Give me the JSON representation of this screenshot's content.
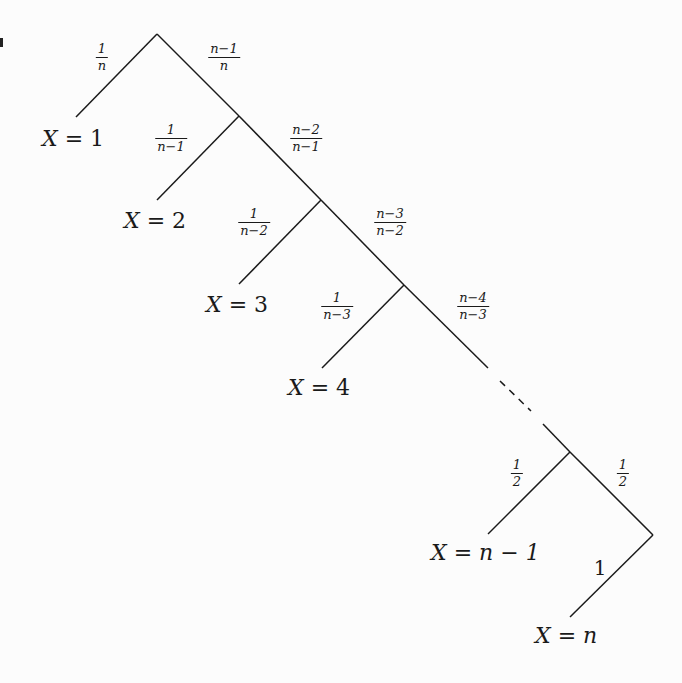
{
  "diagram": {
    "type": "probability-tree",
    "stroke_color": "#1a1a1a",
    "background": "#fcfcfc",
    "nodes": [
      {
        "id": "root",
        "x": 157,
        "y": 34
      },
      {
        "id": "n2",
        "x": 239,
        "y": 116
      },
      {
        "id": "n3",
        "x": 321,
        "y": 200
      },
      {
        "id": "n4",
        "x": 404,
        "y": 285
      },
      {
        "id": "nm1",
        "x": 570,
        "y": 452
      },
      {
        "id": "turn",
        "x": 653,
        "y": 535
      }
    ],
    "edges": [
      {
        "from": [
          157,
          34
        ],
        "to": [
          76,
          117
        ],
        "style": "solid",
        "label_ref": "p1"
      },
      {
        "from": [
          157,
          34
        ],
        "to": [
          239,
          116
        ],
        "style": "solid",
        "label_ref": "q1"
      },
      {
        "from": [
          239,
          116
        ],
        "to": [
          157,
          200
        ],
        "style": "solid",
        "label_ref": "p2"
      },
      {
        "from": [
          239,
          116
        ],
        "to": [
          321,
          200
        ],
        "style": "solid",
        "label_ref": "q2"
      },
      {
        "from": [
          321,
          200
        ],
        "to": [
          239,
          284
        ],
        "style": "solid",
        "label_ref": "p3"
      },
      {
        "from": [
          321,
          200
        ],
        "to": [
          404,
          285
        ],
        "style": "solid",
        "label_ref": "q3"
      },
      {
        "from": [
          404,
          285
        ],
        "to": [
          322,
          368
        ],
        "style": "solid",
        "label_ref": "p4"
      },
      {
        "from": [
          404,
          285
        ],
        "to": [
          488,
          368
        ],
        "style": "solid",
        "label_ref": "q4"
      },
      {
        "from": [
          500,
          381
        ],
        "to": [
          531,
          411
        ],
        "style": "dashed",
        "label_ref": ""
      },
      {
        "from": [
          543,
          424
        ],
        "to": [
          570,
          452
        ],
        "style": "solid",
        "label_ref": ""
      },
      {
        "from": [
          570,
          452
        ],
        "to": [
          488,
          534
        ],
        "style": "solid",
        "label_ref": "p5"
      },
      {
        "from": [
          570,
          452
        ],
        "to": [
          653,
          535
        ],
        "style": "solid",
        "label_ref": "q5"
      },
      {
        "from": [
          653,
          535
        ],
        "to": [
          570,
          617
        ],
        "style": "solid",
        "label_ref": "last"
      }
    ],
    "probabilities": {
      "p1": {
        "num": "1",
        "den": "n",
        "x": 102,
        "y": 57
      },
      "q1": {
        "num": "n−1",
        "den": "n",
        "x": 224,
        "y": 57
      },
      "p2": {
        "num": "1",
        "den": "n−1",
        "x": 171,
        "y": 138
      },
      "q2": {
        "num": "n−2",
        "den": "n−1",
        "x": 306,
        "y": 138
      },
      "p3": {
        "num": "1",
        "den": "n−2",
        "x": 254,
        "y": 222
      },
      "q3": {
        "num": "n−3",
        "den": "n−2",
        "x": 390,
        "y": 222
      },
      "p4": {
        "num": "1",
        "den": "n−3",
        "x": 337,
        "y": 306
      },
      "q4": {
        "num": "n−4",
        "den": "n−3",
        "x": 473,
        "y": 306
      },
      "p5": {
        "num": "1",
        "den": "2",
        "x": 517,
        "y": 473
      },
      "q5": {
        "num": "1",
        "den": "2",
        "x": 623,
        "y": 473
      },
      "last": {
        "text": "1",
        "x": 600,
        "y": 568
      }
    },
    "outcomes": [
      {
        "var": "X",
        "eq": " = ",
        "val": "1",
        "x": 42,
        "y": 128
      },
      {
        "var": "X",
        "eq": " = ",
        "val": "2",
        "x": 124,
        "y": 210
      },
      {
        "var": "X",
        "eq": " = ",
        "val": "3",
        "x": 206,
        "y": 294
      },
      {
        "var": "X",
        "eq": " = ",
        "val": "4",
        "x": 288,
        "y": 377
      },
      {
        "var": "X",
        "eq": " = ",
        "val": "n − 1",
        "x": 431,
        "y": 542
      },
      {
        "var": "X",
        "eq": " = ",
        "val": "n",
        "x": 535,
        "y": 625
      }
    ]
  }
}
